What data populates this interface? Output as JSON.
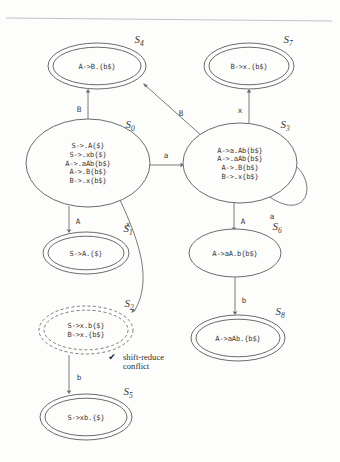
{
  "figure": {
    "kind": "lr-automaton-diagram",
    "background_color": "#fdfdfc",
    "ink_color": "#3a3a3a",
    "stroke_color": "#6b6b6b"
  },
  "top_rule": {
    "name": "page-rule"
  },
  "states": [
    {
      "id": "S0",
      "label_letter": "S",
      "label_sub": "0",
      "shape": "single-ellipse",
      "accepting": false,
      "conflict": false,
      "cx": 88,
      "cy": 163,
      "rx": 62,
      "ry": 44,
      "label_x": 130,
      "label_y": 128,
      "items": [
        "S->.A{$}",
        "S->.xb{$}",
        "A->.aAb{b$}",
        "A->.B{b$}",
        "B->.x{b$}"
      ]
    },
    {
      "id": "S1",
      "label_letter": "S",
      "label_sub": "1",
      "shape": "double-ellipse",
      "accepting": true,
      "conflict": false,
      "cx": 86,
      "cy": 253,
      "rx": 43,
      "ry": 21,
      "label_x": 128,
      "label_y": 232,
      "items": [
        "S->A.{$}"
      ]
    },
    {
      "id": "S2",
      "label_letter": "S",
      "label_sub": "2",
      "shape": "dashed-double-ellipse",
      "accepting": true,
      "conflict": true,
      "cx": 86,
      "cy": 330,
      "rx": 47,
      "ry": 24,
      "label_x": 129,
      "label_y": 307,
      "items": [
        "S->x.b{$}",
        "B->x.{b$}"
      ]
    },
    {
      "id": "S3",
      "label_letter": "S",
      "label_sub": "3",
      "shape": "single-ellipse",
      "accepting": false,
      "conflict": false,
      "cx": 240,
      "cy": 163,
      "rx": 57,
      "ry": 40,
      "label_x": 285,
      "label_y": 128,
      "items": [
        "A->a.Ab{b$}",
        "A->.aAb{b$}",
        "A->.B{b$}",
        "B->.x{b$}"
      ]
    },
    {
      "id": "S4",
      "label_letter": "S",
      "label_sub": "4",
      "shape": "double-ellipse",
      "accepting": true,
      "conflict": false,
      "cx": 97,
      "cy": 66,
      "rx": 49,
      "ry": 23,
      "label_x": 139,
      "label_y": 43,
      "items": [
        "A->B.{b$}"
      ]
    },
    {
      "id": "S5",
      "label_letter": "S",
      "label_sub": "5",
      "shape": "double-ellipse",
      "accepting": true,
      "conflict": false,
      "cx": 86,
      "cy": 417,
      "rx": 46,
      "ry": 23,
      "label_x": 128,
      "label_y": 395,
      "items": [
        "S->xb.{$}"
      ]
    },
    {
      "id": "S6",
      "label_letter": "S",
      "label_sub": "6",
      "shape": "single-ellipse",
      "accepting": false,
      "conflict": false,
      "cx": 235,
      "cy": 253,
      "rx": 46,
      "ry": 24,
      "label_x": 277,
      "label_y": 230,
      "items": [
        "A->aA.b{b$}"
      ]
    },
    {
      "id": "S7",
      "label_letter": "S",
      "label_sub": "7",
      "shape": "double-ellipse",
      "accepting": true,
      "conflict": false,
      "cx": 249,
      "cy": 66,
      "rx": 45,
      "ry": 23,
      "label_x": 288,
      "label_y": 43,
      "items": [
        "B->x.{b$}"
      ]
    },
    {
      "id": "S8",
      "label_letter": "S",
      "label_sub": "8",
      "shape": "double-ellipse",
      "accepting": true,
      "conflict": false,
      "cx": 238,
      "cy": 338,
      "rx": 47,
      "ry": 23,
      "label_x": 280,
      "label_y": 315,
      "items": [
        "A->aAb.{b$}"
      ]
    }
  ],
  "edges": [
    {
      "name": "edge-s0-s4",
      "from": "S0",
      "to": "S4",
      "symbol": "B",
      "label_x": 79,
      "label_y": 112,
      "path": "M 88 119 L 88 92",
      "arrow": {
        "x": 88,
        "y": 89,
        "dir": "up"
      }
    },
    {
      "name": "edge-s0-s3",
      "from": "S0",
      "to": "S3",
      "symbol": "a",
      "label_x": 166,
      "label_y": 158,
      "path": "M 150 165 L 180 165",
      "arrow": {
        "x": 184,
        "y": 165,
        "dir": "right"
      }
    },
    {
      "name": "edge-s0-s1",
      "from": "S0",
      "to": "S1",
      "symbol": "A",
      "label_x": 78,
      "label_y": 224,
      "path": "M 69 206 L 69 229",
      "arrow": {
        "x": 69,
        "y": 233,
        "dir": "down"
      }
    },
    {
      "name": "edge-s0-s2",
      "from": "S0",
      "to": "S2",
      "symbol": "x",
      "label_x": 128,
      "label_y": 227,
      "path": "M 120 200 C 140 243, 152 280, 135 310",
      "arrow": {
        "x": 131,
        "y": 313,
        "dir": "downleft"
      }
    },
    {
      "name": "edge-s2-s5",
      "from": "S2",
      "to": "S5",
      "symbol": "b",
      "label_x": 79,
      "label_y": 380,
      "path": "M 69 355 L 69 390",
      "arrow": {
        "x": 69,
        "y": 394,
        "dir": "down"
      }
    },
    {
      "name": "edge-s3-s4",
      "from": "S3",
      "to": "S4",
      "symbol": "B",
      "label_x": 181,
      "label_y": 116,
      "path": "M 202 136 L 146 86",
      "arrow": {
        "x": 143,
        "y": 83,
        "dir": "upleft"
      }
    },
    {
      "name": "edge-s3-s7",
      "from": "S3",
      "to": "S7",
      "symbol": "x",
      "label_x": 240,
      "label_y": 113,
      "path": "M 249 123 L 249 92",
      "arrow": {
        "x": 249,
        "y": 89,
        "dir": "up"
      }
    },
    {
      "name": "edge-s3-s6",
      "from": "S3",
      "to": "S6",
      "symbol": "A",
      "label_x": 243,
      "label_y": 224,
      "path": "M 234 203 L 234 227",
      "arrow": {
        "x": 234,
        "y": 231,
        "dir": "down"
      }
    },
    {
      "name": "edge-s3-self",
      "from": "S3",
      "to": "S3",
      "symbol": "a",
      "label_x": 272,
      "label_y": 219,
      "path": "M 268 196 C 300 218, 312 196, 305 179 C 300 166, 290 161, 284 166",
      "arrow": {
        "x": 286,
        "y": 165,
        "dir": "upleft"
      }
    },
    {
      "name": "edge-s6-s8",
      "from": "S6",
      "to": "S8",
      "symbol": "b",
      "label_x": 244,
      "label_y": 303,
      "path": "M 235 277 L 235 311",
      "arrow": {
        "x": 235,
        "y": 315,
        "dir": "down"
      }
    }
  ],
  "annotations": [
    {
      "name": "shift-reduce-conflict-note",
      "icon": "check-mark-icon",
      "icon_glyph": "✔",
      "icon_x": 112,
      "icon_y": 360,
      "line1": "shift-reduce",
      "line2": "conflict",
      "text_x": 123,
      "text_y": 360,
      "line2_y": 369,
      "target_state": "S2"
    }
  ]
}
